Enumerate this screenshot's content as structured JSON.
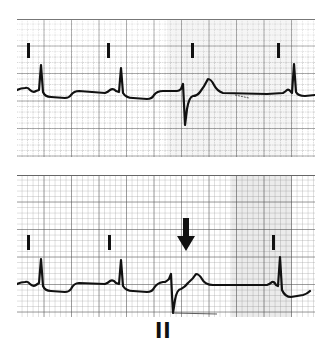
{
  "figure": {
    "type": "ecg-rhythm-strips",
    "strips": [
      {
        "id": "strip-top",
        "markers_x": [
          28,
          108,
          192,
          278
        ],
        "beats": [
          "normal",
          "normal",
          "premature-ventricular",
          "normal"
        ]
      },
      {
        "id": "strip-bottom",
        "markers_x": [
          27,
          108,
          272
        ],
        "beats": [
          "normal",
          "normal",
          "premature-ventricular",
          "normal"
        ],
        "annotation": "arrow-pointing-down-at-premature-beat"
      }
    ],
    "lead_label": "II",
    "colors": {
      "trace": "#111111",
      "grid_major": "#555555",
      "grid_minor": "#9a9a9a",
      "paper": "#ffffff"
    }
  }
}
